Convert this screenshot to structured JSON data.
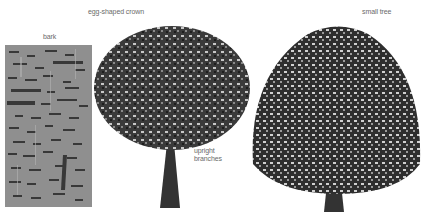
{
  "labels": {
    "top_cut": "",
    "egg_crown": "egg-shaped crown",
    "bark": "bark",
    "small_tree": "small tree",
    "upright": "upright",
    "branches": "branches"
  },
  "colors": {
    "bark": "#8f8f8f",
    "bark_dark": "#2a2a2a",
    "foliage_dark": "#1e1e1e",
    "foliage_mid": "#4a4a4a",
    "foliage_light": "#c8c8c8",
    "trunk": "#333333",
    "label": "#6a6a6a"
  }
}
